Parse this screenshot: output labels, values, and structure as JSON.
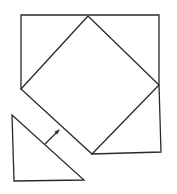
{
  "diagram": {
    "colors": {
      "stroke": "#2a2a2a",
      "background": "#ffffff"
    },
    "outer_square": {
      "points": [
        [
          21,
          15
        ],
        [
          159,
          15
        ],
        [
          161,
          152
        ],
        [
          92,
          154
        ],
        [
          21,
          89
        ]
      ]
    },
    "inner_square": {
      "points": [
        [
          88,
          16
        ],
        [
          159,
          85
        ],
        [
          92,
          154
        ],
        [
          21,
          89
        ]
      ]
    },
    "triangle": {
      "points": [
        [
          12,
          115
        ],
        [
          14,
          181
        ],
        [
          84,
          180
        ]
      ]
    },
    "arrow": {
      "from": [
        45,
        144
      ],
      "to": [
        59,
        130
      ]
    }
  }
}
